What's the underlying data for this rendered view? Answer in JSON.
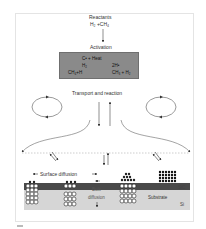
{
  "diagram": {
    "type": "process-diagram",
    "reactants": {
      "label": "Reactants",
      "formula": "H₂ +CH₄"
    },
    "activation": {
      "label": "Activation",
      "reactions": [
        {
          "left": "C•  + Heat",
          "right": ""
        },
        {
          "left": "H₂",
          "right": "2H•"
        },
        {
          "left": "CH₄+H",
          "right": "CH₃ + H₂"
        }
      ],
      "box_color": "#8a8a8a"
    },
    "transport": {
      "label": "Transport and reaction"
    },
    "surface": {
      "surface_diffusion_label": "Surface diffusion",
      "bulk_diffusion_label_1": "Bulk",
      "bulk_diffusion_label_2": "diffusion",
      "substrate_label": "Substrate",
      "interlayer_label": "SiC",
      "base_label": "Si"
    },
    "colors": {
      "sic_layer": "#4a4a4a",
      "si_layer": "#d6d6d6",
      "arrows": "#444444",
      "dotted_line": "#9a9a9a"
    }
  }
}
